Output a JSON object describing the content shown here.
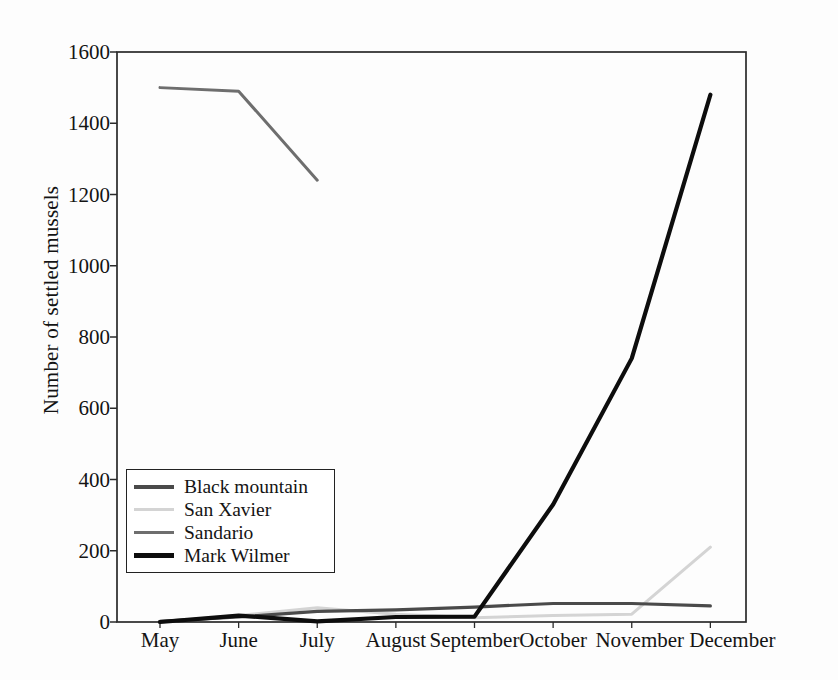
{
  "chart_data": {
    "type": "line",
    "title": "",
    "xlabel": "",
    "ylabel": "Number of settled mussels",
    "categories": [
      "May",
      "June",
      "July",
      "August",
      "September",
      "October",
      "November",
      "December"
    ],
    "ylim": [
      0,
      1600
    ],
    "yticks": [
      0,
      200,
      400,
      600,
      800,
      1000,
      1200,
      1400,
      1600
    ],
    "grid": false,
    "legend_position": "inside-lower-left",
    "series": [
      {
        "name": "Black mountain",
        "color": "#4a4a4a",
        "width": 3.2,
        "values": [
          2,
          14,
          30,
          34,
          42,
          52,
          52,
          45
        ]
      },
      {
        "name": "San Xavier",
        "color": "#d4d4d4",
        "width": 3.0,
        "values": [
          0,
          18,
          40,
          22,
          12,
          18,
          22,
          210
        ]
      },
      {
        "name": "Sandario",
        "color": "#6e6e6e",
        "width": 3.0,
        "values": [
          1500,
          1490,
          1240,
          null,
          null,
          null,
          null,
          null
        ]
      },
      {
        "name": "Mark Wilmer",
        "color": "#0d0d0d",
        "width": 4.2,
        "values": [
          0,
          18,
          2,
          14,
          15,
          330,
          740,
          1480
        ]
      }
    ]
  },
  "axes": {
    "y_tick_labels": [
      "1600",
      "1400",
      "1200",
      "1000",
      "800",
      "600",
      "400",
      "200",
      "0"
    ],
    "y_axis_title": "Number of settled mussels",
    "x_tick_labels": [
      "May",
      "June",
      "July",
      "August",
      "September",
      "October",
      "November",
      "December"
    ]
  },
  "legend": {
    "entries": [
      {
        "label": "Black mountain",
        "color": "#4a4a4a",
        "width": 4
      },
      {
        "label": "San Xavier",
        "color": "#d4d4d4",
        "width": 3
      },
      {
        "label": "Sandario",
        "color": "#6e6e6e",
        "width": 3.5
      },
      {
        "label": "Mark Wilmer",
        "color": "#0d0d0d",
        "width": 5
      }
    ]
  },
  "plot_frame": {
    "left": 117,
    "top": 52,
    "right": 746,
    "bottom": 622,
    "border_color": "#2a2a2a"
  }
}
